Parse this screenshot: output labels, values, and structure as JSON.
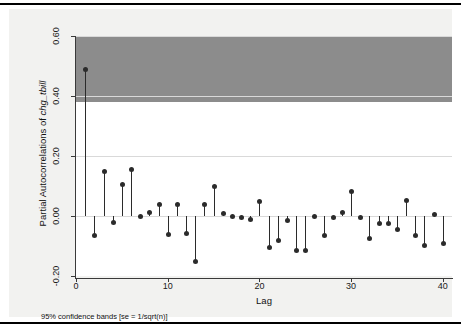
{
  "chart_data": {
    "type": "bar",
    "title": "",
    "subtitle": "",
    "xlabel": "Lag",
    "ylabel": "Partial Autocorrelations of chg_tbill",
    "ylabel_plain": "Partial Autocorrelations of ",
    "ylabel_italic": "chg_tbill",
    "note": "95% confidence bands [se = 1/sqrt(n)]",
    "xlim": [
      0,
      41
    ],
    "ylim": [
      -0.2,
      0.6
    ],
    "xticks": [
      0,
      10,
      20,
      30,
      40
    ],
    "xtick_labels": [
      "0",
      "10",
      "20",
      "30",
      "40"
    ],
    "yticks": [
      -0.2,
      0.0,
      0.2,
      0.4,
      0.6
    ],
    "ytick_labels": [
      "-0.20",
      "0.00",
      "0.20",
      "0.40",
      "0.60"
    ],
    "grid": true,
    "legend": "none",
    "confidence_band": {
      "upper": 0.11,
      "lower": -0.11,
      "color": "#8c8c8c",
      "label": "95% confidence bands [se = 1/sqrt(n)]"
    },
    "marker_color": "#2b2b2b",
    "stem_color": "#2b2b2b",
    "categories": [
      1,
      2,
      3,
      4,
      5,
      6,
      7,
      8,
      9,
      10,
      11,
      12,
      13,
      14,
      15,
      16,
      17,
      18,
      19,
      20,
      21,
      22,
      23,
      24,
      25,
      26,
      27,
      28,
      29,
      30,
      31,
      32,
      33,
      34,
      35,
      36,
      37,
      38,
      39,
      40
    ],
    "values": [
      0.49,
      -0.065,
      0.148,
      -0.021,
      0.104,
      0.155,
      -0.002,
      0.012,
      0.04,
      -0.062,
      0.04,
      -0.059,
      -0.152,
      0.038,
      0.1,
      0.01,
      -0.002,
      -0.006,
      -0.01,
      0.05,
      -0.105,
      -0.082,
      -0.016,
      -0.115,
      -0.115,
      0.0,
      -0.065,
      -0.005,
      0.013,
      0.083,
      -0.006,
      -0.075,
      -0.025,
      -0.024,
      -0.044,
      0.052,
      -0.064,
      -0.098,
      0.006,
      -0.09
    ]
  },
  "figure": {
    "background": "#f2f2f0",
    "plot_background": "#ffffff",
    "frame_color": "#000000"
  }
}
